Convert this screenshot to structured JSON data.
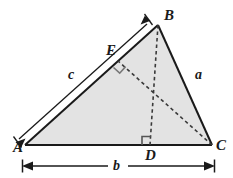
{
  "figure": {
    "type": "geometry-diagram",
    "background_color": "#ffffff",
    "fill_color": "#e3e3e3",
    "stroke_color": "#1a1a1a",
    "dash_color": "#3a3a3a"
  },
  "vertices": [
    {
      "name": "A",
      "label": "A",
      "x": 25,
      "y": 145
    },
    {
      "name": "B",
      "label": "B",
      "x": 158,
      "y": 25
    },
    {
      "name": "C",
      "label": "C",
      "x": 212,
      "y": 145
    },
    {
      "name": "D",
      "label": "D",
      "x": 150,
      "y": 145
    },
    {
      "name": "E",
      "label": "E",
      "x": 118,
      "y": 61
    }
  ],
  "labels": {
    "A": "A",
    "B": "B",
    "C": "C",
    "D": "D",
    "E": "E",
    "side_a": "a",
    "side_b": "b",
    "side_c": "c"
  },
  "sides": [
    {
      "name": "a",
      "label": "a",
      "from": "B",
      "to": "C"
    },
    {
      "name": "b",
      "label": "b",
      "from": "A",
      "to": "C"
    },
    {
      "name": "c",
      "label": "c",
      "from": "A",
      "to": "B"
    }
  ],
  "segments": [
    {
      "name": "altitude-B-to-D",
      "from": "B",
      "to": "D",
      "style": "dashed"
    },
    {
      "name": "altitude-C-to-E",
      "from": "C",
      "to": "E",
      "style": "dashed"
    }
  ],
  "right_angles": [
    {
      "name": "right-angle-at-D",
      "at": "D"
    },
    {
      "name": "right-angle-at-E",
      "at": "E"
    }
  ],
  "dimension_lines": [
    {
      "name": "dimension-c",
      "label": "c",
      "orientation": "parallel-to-AB",
      "arrows": "both"
    },
    {
      "name": "dimension-b",
      "label": "b",
      "orientation": "horizontal-below-base",
      "arrows": "both"
    }
  ]
}
